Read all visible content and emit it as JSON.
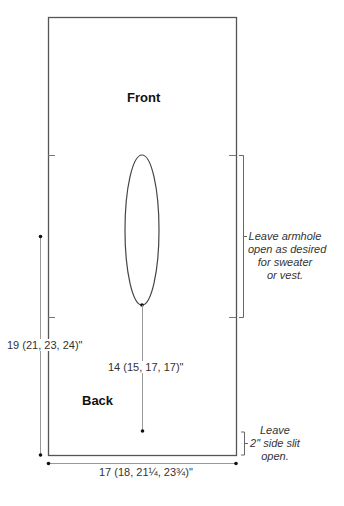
{
  "diagram": {
    "type": "knitting-schematic",
    "panel": {
      "front_label": "Front",
      "back_label": "Back"
    },
    "dimensions": {
      "length": "19 (21, 23, 24)\"",
      "neck_depth": "14 (15, 17, 17)\"",
      "width": "17 (18, 21¼, 23¾)\""
    },
    "notes": {
      "armhole": [
        "Leave armhole",
        "open as desired",
        "for sweater",
        "or vest."
      ],
      "side_slit": [
        "Leave",
        "2\" side slit",
        "open."
      ]
    },
    "colors": {
      "outline": "#555555",
      "dimension_line": "#999999",
      "dot": "#111111",
      "text": "#333333"
    }
  }
}
